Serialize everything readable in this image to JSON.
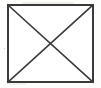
{
  "figure": {
    "name": "crossed-box-placeholder",
    "caption": "",
    "canvas": {
      "width": 101,
      "height": 88,
      "background_color": "#fdfdfc"
    },
    "box": {
      "left": 8,
      "top": 5,
      "right": 93,
      "bottom": 82,
      "width": 85,
      "height": 77,
      "stroke_color": "#3a3a3a",
      "stroke_width": 1.6,
      "fill_color": "#ffffff"
    },
    "diagonals": [
      {
        "name": "diagonal-top-left-to-bottom-right",
        "x1": 8,
        "y1": 5,
        "x2": 93,
        "y2": 82,
        "stroke_color": "#3a3a3a",
        "stroke_width": 1.6
      },
      {
        "name": "diagonal-bottom-left-to-top-right",
        "x1": 8,
        "y1": 82,
        "x2": 93,
        "y2": 5,
        "stroke_color": "#3a3a3a",
        "stroke_width": 1.6
      }
    ],
    "intersection": {
      "x": 50.5,
      "y": 43.5
    },
    "artifacts": {
      "type": "scan-bleed-through",
      "color": "#d9cfc0",
      "legible_text": ""
    }
  }
}
